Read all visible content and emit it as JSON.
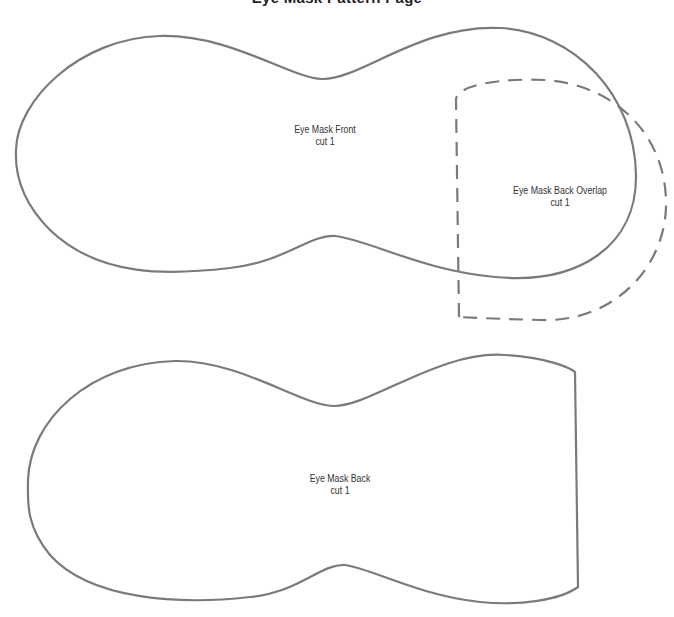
{
  "page": {
    "title_clipped": "Eye Mask Pattern Page",
    "line_color": "#7a7a7a",
    "background": "#ffffff"
  },
  "pieces": [
    {
      "id": "front",
      "name": "Eye Mask Front",
      "instruction": "cut 1",
      "outline": "solid"
    },
    {
      "id": "back-overlap",
      "name": "Eye Mask  Back Overlap",
      "instruction": "cut 1",
      "outline": "dashed"
    },
    {
      "id": "back",
      "name": "Eye Mask Back",
      "instruction": "cut 1",
      "outline": "solid"
    }
  ]
}
